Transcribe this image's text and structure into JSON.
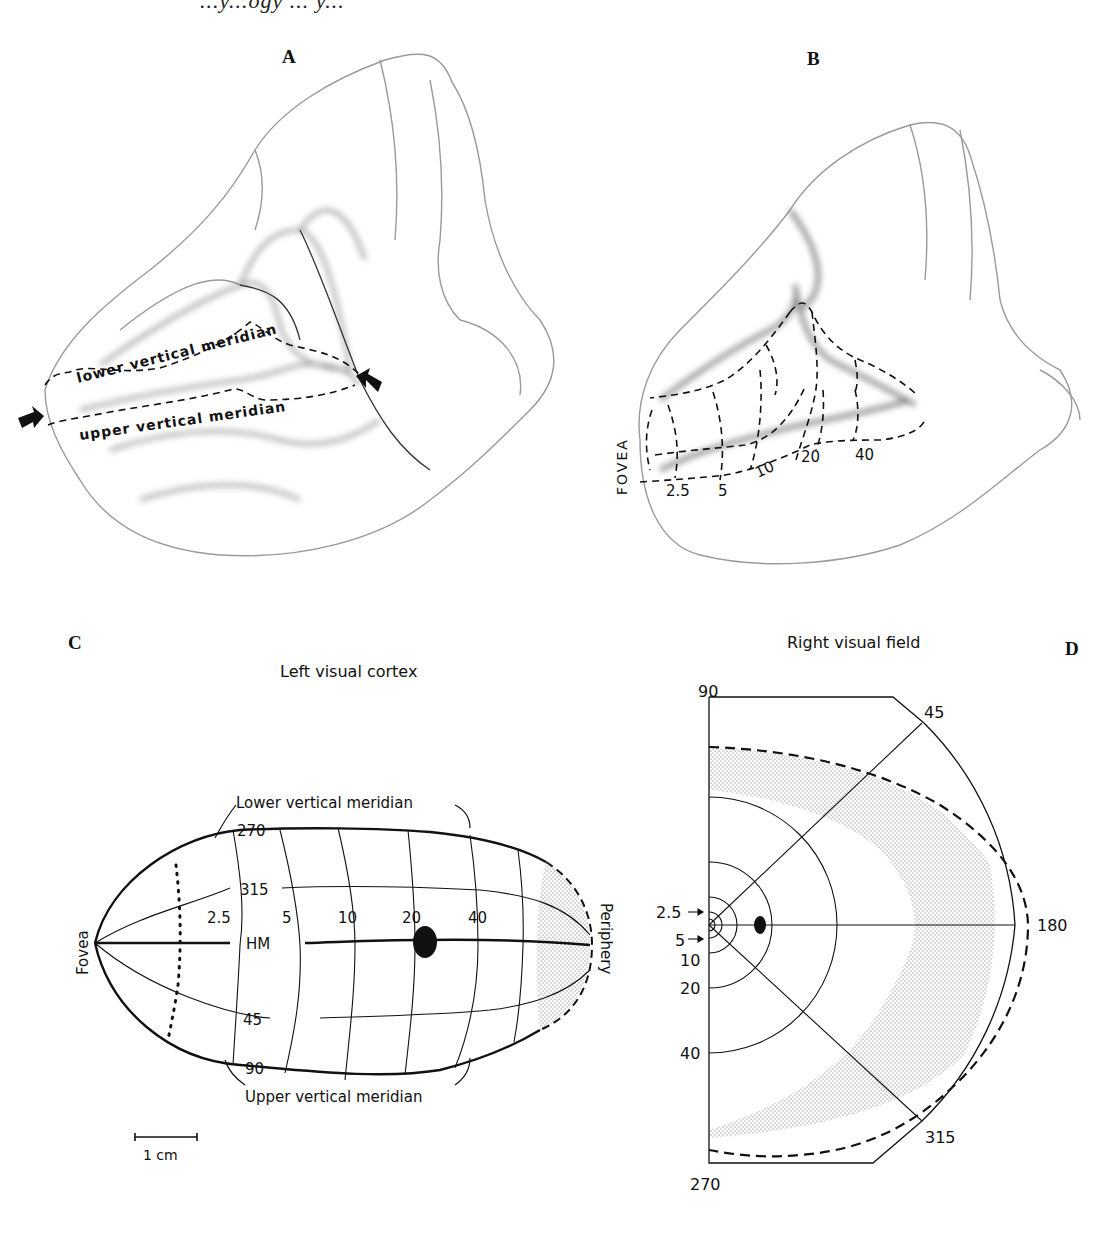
{
  "page": {
    "running_head": "...y...ogy ... y..."
  },
  "panels": {
    "A": {
      "letter": "A",
      "labels": {
        "lower_meridian": "lower vertical meridian",
        "upper_meridian": "upper vertical meridian"
      },
      "icons": [
        "arrow-left-boundary-icon",
        "arrow-right-boundary-icon"
      ]
    },
    "B": {
      "letter": "B",
      "fovea_label": "FOVEA",
      "eccentricities": [
        "2.5",
        "5",
        "10",
        "20",
        "40"
      ]
    },
    "C": {
      "letter": "C",
      "title": "Left visual cortex",
      "lower_vertical_meridian": "Lower vertical meridian",
      "upper_vertical_meridian": "Upper vertical meridian",
      "fovea": "Fovea",
      "periphery": "Periphery",
      "horizontal_meridian": "HM",
      "isopolar_labels": {
        "top": "270",
        "upper_mid": "315",
        "lower_mid": "45",
        "bottom": "90"
      },
      "eccentricities": [
        "2.5",
        "5",
        "10",
        "20",
        "40"
      ],
      "scale_bar": "1 cm"
    },
    "D": {
      "letter": "D",
      "title": "Right visual field",
      "polar_labels": {
        "top": "90",
        "upper_diag": "45",
        "right": "180",
        "lower_diag": "315",
        "bottom": "270"
      },
      "eccentricities": [
        "2.5",
        "5",
        "10",
        "20",
        "40"
      ]
    }
  },
  "colors": {
    "ink": "#111111",
    "stipple": "#777777",
    "brain_shade": "#bdbdbd",
    "background": "#ffffff"
  }
}
